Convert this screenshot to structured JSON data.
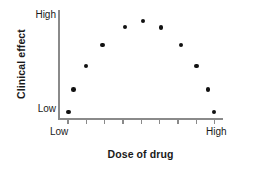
{
  "chart_data": {
    "type": "scatter",
    "title": "",
    "xlabel": "Dose of drug",
    "ylabel": "Clinical effect",
    "xlim": [
      0,
      10
    ],
    "ylim": [
      0,
      10
    ],
    "xtick_labels": [
      "Low",
      "High"
    ],
    "ytick_labels": [
      "Low",
      "High"
    ],
    "x_tick_count": 9,
    "grid": false,
    "legend": null,
    "point_color": "#111111",
    "axis_color": "#8a8a8a",
    "background_color": "#ffffff",
    "points": [
      {
        "x": 0.65,
        "y": 0.55
      },
      {
        "x": 0.95,
        "y": 2.7
      },
      {
        "x": 1.7,
        "y": 4.9
      },
      {
        "x": 2.7,
        "y": 6.9
      },
      {
        "x": 4.05,
        "y": 8.6
      },
      {
        "x": 5.15,
        "y": 9.15
      },
      {
        "x": 6.25,
        "y": 8.55
      },
      {
        "x": 7.45,
        "y": 6.9
      },
      {
        "x": 8.4,
        "y": 4.9
      },
      {
        "x": 9.1,
        "y": 2.7
      },
      {
        "x": 9.45,
        "y": 0.55
      }
    ],
    "series_name": "Dose-response observations"
  },
  "axes": {
    "y_title": "Clinical effect",
    "y_tick_high": "High",
    "y_tick_low": "Low",
    "x_title": "Dose of drug",
    "x_tick_low": "Low",
    "x_tick_high": "High"
  }
}
